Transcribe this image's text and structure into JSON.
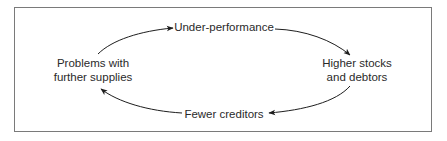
{
  "diagram": {
    "type": "cycle",
    "nodes": [
      {
        "id": "under-performance",
        "lines": [
          "Under-performance"
        ]
      },
      {
        "id": "higher-stocks",
        "lines": [
          "Higher stocks",
          "and debtors"
        ]
      },
      {
        "id": "fewer-creditors",
        "lines": [
          "Fewer creditors"
        ]
      },
      {
        "id": "problems-supplies",
        "lines": [
          "Problems with",
          "further supplies"
        ]
      }
    ],
    "edges": [
      {
        "from": "problems-supplies",
        "to": "under-performance"
      },
      {
        "from": "under-performance",
        "to": "higher-stocks"
      },
      {
        "from": "higher-stocks",
        "to": "fewer-creditors"
      },
      {
        "from": "fewer-creditors",
        "to": "problems-supplies"
      }
    ],
    "colors": {
      "text": "#2a2a2a",
      "arrow": "#1e1e1e",
      "frame": "#7a7a7a",
      "background": "#ffffff"
    }
  }
}
